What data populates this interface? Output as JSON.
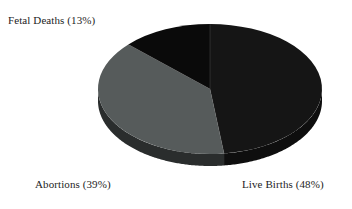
{
  "figure": {
    "background_color": "#ffffff",
    "text_color": "#1d1d1d"
  },
  "chart_data": {
    "type": "pie",
    "title": "",
    "subtitle": "",
    "xlabel": "",
    "ylabel": "",
    "legend_position": "none",
    "grid": false,
    "three_d": true,
    "start_angle_deg": -90,
    "direction": "clockwise",
    "categories": [
      "Live Births",
      "Abortions",
      "Fetal Deaths"
    ],
    "values": [
      48,
      39,
      13
    ],
    "value_unit": "%",
    "colors": [
      "#151515",
      "#565b5b",
      "#0a0a0a"
    ],
    "labels": [
      "Live Births (48%)",
      "Abortions (39%)",
      "Fetal Deaths (13%)"
    ],
    "slices": [
      {
        "name": "Live Births",
        "value": 48,
        "label": "Live Births (48%)",
        "color": "#151515",
        "side_color": "#0e0e0e"
      },
      {
        "name": "Abortions",
        "value": 39,
        "label": "Abortions (39%)",
        "color": "#565b5b",
        "side_color": "#2a2d2d"
      },
      {
        "name": "Fetal Deaths",
        "value": 13,
        "label": "Fetal Deaths (13%)",
        "color": "#0a0a0a",
        "side_color": "#070707"
      }
    ]
  },
  "labels": {
    "fetal_deaths": "Fetal Deaths (13%)",
    "abortions": "Abortions (39%)",
    "live_births": "Live Births (48%)"
  }
}
